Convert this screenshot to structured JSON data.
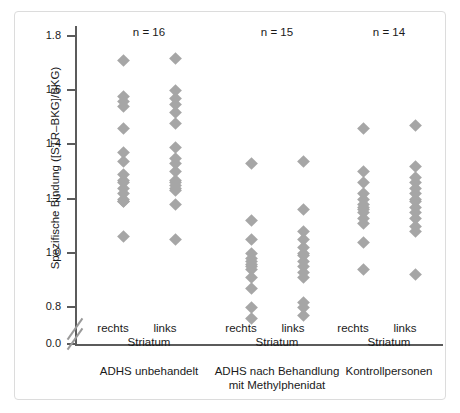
{
  "chart_data": {
    "type": "scatter",
    "title": "",
    "xlabel": "",
    "ylabel": "Spezifische Bindung ([STR–BKG]/BKG)",
    "ylim": [
      0.8,
      1.8
    ],
    "yticks": [
      1.8,
      1.6,
      1.4,
      1.2,
      1.0,
      0.8
    ],
    "ytick_labels": [
      "1.8",
      "1.6",
      "1.4",
      "1.2",
      "1.0",
      "0.8"
    ],
    "origin_label": "0.0",
    "axis_break": true,
    "grid": false,
    "legend": "none",
    "side_label_left": "rechts",
    "side_label_right": "links",
    "side_label_sub": "Striatum",
    "groups": [
      {
        "caption": "ADHS unbehandelt",
        "n_label": "n = 16",
        "n": 16,
        "series": [
          {
            "name": "rechts",
            "values": [
              1.76,
              1.63,
              1.61,
              1.59,
              1.51,
              1.42,
              1.39,
              1.34,
              1.32,
              1.31,
              1.29,
              1.27,
              1.25,
              1.24,
              1.24,
              1.11
            ]
          },
          {
            "name": "links",
            "values": [
              1.77,
              1.65,
              1.62,
              1.6,
              1.57,
              1.53,
              1.44,
              1.4,
              1.38,
              1.35,
              1.32,
              1.31,
              1.3,
              1.29,
              1.28,
              1.23,
              1.1
            ]
          }
        ]
      },
      {
        "caption": "ADHS nach Behandlung mit Methylphenidat",
        "caption_line1": "ADHS nach Behandlung",
        "caption_line2": "mit Methylphenidat",
        "n_label": "n = 15",
        "n": 15,
        "series": [
          {
            "name": "rechts",
            "values": [
              1.38,
              1.17,
              1.1,
              1.05,
              1.03,
              1.02,
              1.01,
              1.0,
              0.99,
              0.96,
              0.92,
              0.85,
              0.81
            ]
          },
          {
            "name": "links",
            "values": [
              1.39,
              1.21,
              1.13,
              1.1,
              1.07,
              1.05,
              1.04,
              1.02,
              1.0,
              0.98,
              0.96,
              0.87,
              0.85,
              0.82
            ]
          }
        ]
      },
      {
        "caption": "Kontrollpersonen",
        "n_label": "n = 14",
        "n": 14,
        "series": [
          {
            "name": "rechts",
            "values": [
              1.51,
              1.35,
              1.31,
              1.27,
              1.25,
              1.23,
              1.22,
              1.21,
              1.2,
              1.18,
              1.16,
              1.09,
              0.99
            ]
          },
          {
            "name": "links",
            "values": [
              1.52,
              1.37,
              1.33,
              1.31,
              1.29,
              1.27,
              1.25,
              1.24,
              1.22,
              1.2,
              1.18,
              1.15,
              1.13,
              0.97
            ]
          }
        ]
      }
    ],
    "marker": {
      "shape": "diamond",
      "color": "#a6a6a6",
      "size_px": 9
    },
    "axis_color": "#5b5b5b",
    "frame_color": "#dcdcdc"
  }
}
